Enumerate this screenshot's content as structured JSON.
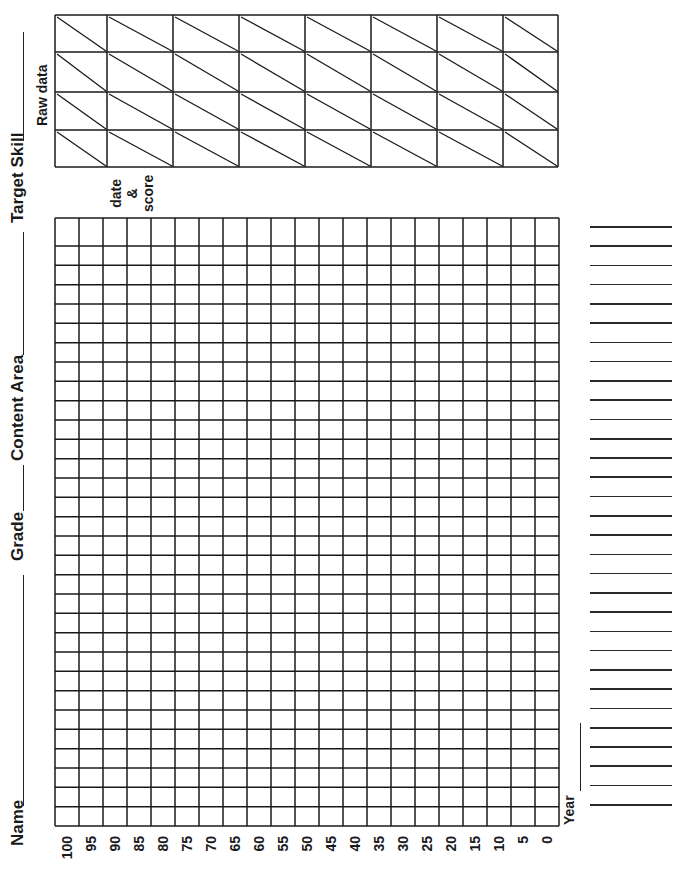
{
  "header_fields": {
    "name_label": "Name",
    "grade_label": "Grade",
    "content_area_label": "Content Area",
    "target_skill_label": "Target Skill"
  },
  "raw_data_section": {
    "label": "Raw data",
    "sublabel_line1": "date",
    "sublabel_line2": "&",
    "sublabel_line3": "score",
    "columns": 8,
    "rows": 4
  },
  "graph": {
    "score_axis_labels": [
      "100",
      "95",
      "90",
      "85",
      "80",
      "75",
      "70",
      "65",
      "60",
      "55",
      "50",
      "45",
      "40",
      "35",
      "30",
      "25",
      "20",
      "15",
      "10",
      "5",
      "0"
    ],
    "rows": 31
  },
  "date_column": {
    "year_label": "Year",
    "line_count": 31
  },
  "colors": {
    "ink": "#1a1a1a",
    "paper": "#ffffff"
  }
}
